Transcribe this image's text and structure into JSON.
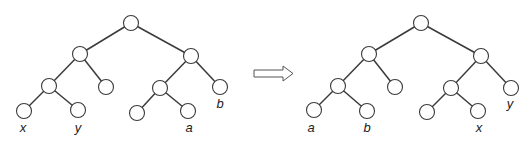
{
  "diagram": {
    "type": "binary-tree-rotation",
    "node_radius": 7.5,
    "colors": {
      "stroke": "#3a3a3a",
      "fill": "#ffffff",
      "label": "#222222"
    },
    "trees": [
      {
        "name": "before",
        "nodes": [
          {
            "id": "root",
            "x": 131,
            "y": 23
          },
          {
            "id": "L",
            "x": 80,
            "y": 54
          },
          {
            "id": "R",
            "x": 191,
            "y": 56
          },
          {
            "id": "LL",
            "x": 49,
            "y": 86
          },
          {
            "id": "LR",
            "x": 106,
            "y": 87
          },
          {
            "id": "LLL",
            "x": 24,
            "y": 111,
            "label": "x",
            "lx": 23,
            "ly": 132
          },
          {
            "id": "LLR",
            "x": 78,
            "y": 110,
            "label": "y",
            "lx": 78,
            "ly": 132
          },
          {
            "id": "RL",
            "x": 160,
            "y": 88
          },
          {
            "id": "RR",
            "x": 220,
            "y": 87,
            "label": "b",
            "lx": 220,
            "ly": 108
          },
          {
            "id": "RLL",
            "x": 137,
            "y": 113
          },
          {
            "id": "RLR",
            "x": 188,
            "y": 111,
            "label": "a",
            "lx": 189,
            "ly": 132
          }
        ],
        "edges": [
          [
            "root",
            "L"
          ],
          [
            "root",
            "R"
          ],
          [
            "L",
            "LL"
          ],
          [
            "L",
            "LR"
          ],
          [
            "LL",
            "LLL"
          ],
          [
            "LL",
            "LLR"
          ],
          [
            "R",
            "RL"
          ],
          [
            "R",
            "RR"
          ],
          [
            "RL",
            "RLL"
          ],
          [
            "RL",
            "RLR"
          ]
        ]
      },
      {
        "name": "after",
        "nodes": [
          {
            "id": "root",
            "x": 421,
            "y": 23
          },
          {
            "id": "L",
            "x": 369,
            "y": 54
          },
          {
            "id": "R",
            "x": 481,
            "y": 56
          },
          {
            "id": "LL",
            "x": 338,
            "y": 86
          },
          {
            "id": "LR",
            "x": 395,
            "y": 87
          },
          {
            "id": "LLL",
            "x": 314,
            "y": 110,
            "label": "a",
            "lx": 311,
            "ly": 132
          },
          {
            "id": "LLR",
            "x": 367,
            "y": 111,
            "label": "b",
            "lx": 367,
            "ly": 132
          },
          {
            "id": "RL",
            "x": 451,
            "y": 88
          },
          {
            "id": "RR",
            "x": 511,
            "y": 88,
            "label": "y",
            "lx": 510,
            "ly": 108
          },
          {
            "id": "RLL",
            "x": 427,
            "y": 112
          },
          {
            "id": "RLR",
            "x": 478,
            "y": 111,
            "label": "x",
            "lx": 479,
            "ly": 132
          }
        ],
        "edges": [
          [
            "root",
            "L"
          ],
          [
            "root",
            "R"
          ],
          [
            "L",
            "LL"
          ],
          [
            "L",
            "LR"
          ],
          [
            "LL",
            "LLL"
          ],
          [
            "LL",
            "LLR"
          ],
          [
            "R",
            "RL"
          ],
          [
            "R",
            "RR"
          ],
          [
            "RL",
            "RLL"
          ],
          [
            "RL",
            "RLR"
          ]
        ]
      }
    ],
    "arrow": {
      "direction": "right",
      "x1": 254,
      "x2": 293,
      "y": 73.5,
      "shaft_half": 3.5,
      "head_half": 7.5,
      "head_len": 10,
      "style": "hollow"
    }
  }
}
